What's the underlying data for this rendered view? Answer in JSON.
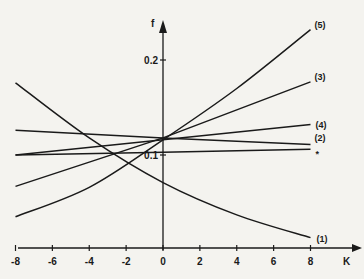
{
  "chart_data": {
    "type": "line",
    "title": "",
    "xlabel": "K",
    "ylabel": "f",
    "xlim": [
      -8,
      8
    ],
    "ylim": [
      0,
      0.2
    ],
    "x_ticks": [
      -8,
      -6,
      -4,
      -2,
      0,
      2,
      4,
      6,
      8
    ],
    "x_tick_labels": [
      "-8",
      "-6",
      "-4",
      "-2",
      "0",
      "2",
      "4",
      "6",
      "8"
    ],
    "y_ticks": [
      0.1,
      0.2
    ],
    "y_tick_labels": [
      "0.1",
      "0.2"
    ],
    "grid": false,
    "series": [
      {
        "name": "(1)",
        "x": [
          -8,
          -4,
          0,
          4,
          8
        ],
        "values": [
          0.176,
          0.118,
          0.071,
          0.037,
          0.013
        ]
      },
      {
        "name": "(5)",
        "x": [
          -8,
          -4,
          0,
          4,
          8
        ],
        "values": [
          0.035,
          0.066,
          0.116,
          0.17,
          0.232
        ]
      },
      {
        "name": "(3)",
        "x": [
          -8,
          0,
          8
        ],
        "values": [
          0.067,
          0.118,
          0.177
        ]
      },
      {
        "name": "(4)",
        "x": [
          -8,
          0,
          8
        ],
        "values": [
          0.1,
          0.116,
          0.132
        ]
      },
      {
        "name": "(2)",
        "x": [
          -8,
          0,
          8
        ],
        "values": [
          0.126,
          0.118,
          0.111
        ]
      },
      {
        "name": "(2)*",
        "x": [
          -8,
          0,
          8
        ],
        "values": [
          0.1,
          0.103,
          0.106
        ]
      }
    ],
    "annotations": [
      {
        "text": "(1)",
        "series": "(1)"
      },
      {
        "text": "(5)",
        "series": "(5)"
      },
      {
        "text": "(3)",
        "series": "(3)"
      },
      {
        "text": "(4)",
        "series": "(4)"
      },
      {
        "text": "(2)",
        "series": "(2)"
      },
      {
        "text": "*",
        "series": "(2)*"
      }
    ]
  }
}
